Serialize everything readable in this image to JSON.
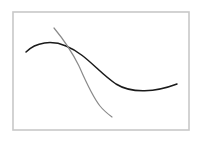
{
  "diagram": {
    "frame": {
      "x": 13,
      "y": 12,
      "width": 176,
      "height": 118,
      "stroke": "#c8c8c8",
      "stroke_width": 1.6
    },
    "curves": [
      {
        "name": "dark-curve",
        "color": "#1a1a1a",
        "stroke_width": 1.5,
        "path": "M26,52 C36,42 52,40 66,46 C86,54 98,72 116,84 C132,94 156,92 177,84"
      },
      {
        "name": "gray-curve",
        "color": "#8a8a8a",
        "stroke_width": 1.2,
        "path": "M54,28 C64,40 72,52 79,66 C86,82 92,96 100,106 C104,111 108,114 112,117"
      }
    ]
  }
}
